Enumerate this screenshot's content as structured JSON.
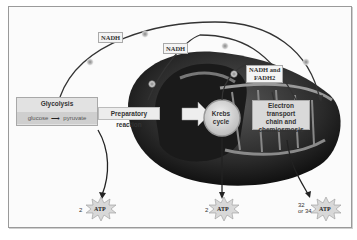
{
  "diagram": {
    "nodes": {
      "glycolysis": {
        "title": "Glycolysis",
        "input": "glucose",
        "output": "pyruvate"
      },
      "preparatory": {
        "label": "Preparatory reaction"
      },
      "krebs": {
        "line1": "Krebs",
        "line2": "cycle"
      },
      "etc": {
        "line1": "Electron transport",
        "line2": "chain and",
        "line3": "chemiosmosis"
      }
    },
    "carriers": {
      "nadh_1": "NADH",
      "nadh_2": "NADH",
      "nadh_fadh2_line1": "NADH and",
      "nadh_fadh2_line2": "FADH2"
    },
    "atp_yields": [
      {
        "amount": "2",
        "label": "ATP"
      },
      {
        "amount": "2",
        "label": "ATP"
      },
      {
        "amount_line1": "32",
        "amount_line2": "or 34",
        "label": "ATP"
      }
    ],
    "electron_symbol": "e-"
  }
}
